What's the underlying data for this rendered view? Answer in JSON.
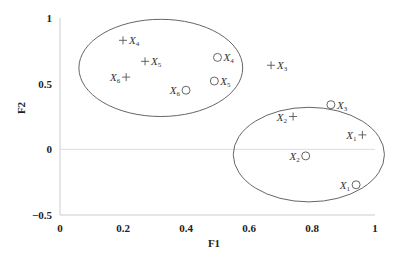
{
  "chart_data": {
    "type": "scatter",
    "title": "",
    "xlabel": "F1",
    "ylabel": "F2",
    "xlim": [
      0,
      1
    ],
    "ylim": [
      -0.5,
      1
    ],
    "x_ticks": [
      "0",
      "0.2",
      "0.4",
      "0.6",
      "0.8",
      "1"
    ],
    "y_ticks": [
      "1",
      "0.5",
      "0",
      "-0.5"
    ],
    "grid": false,
    "zero_line": true,
    "legend": null,
    "series": [
      {
        "name": "plus markers",
        "marker": "+",
        "points": [
          {
            "label": "X",
            "sub": "4",
            "x": 0.2,
            "y": 0.83,
            "label_side": "right"
          },
          {
            "label": "X",
            "sub": "5",
            "x": 0.27,
            "y": 0.67,
            "label_side": "right"
          },
          {
            "label": "X",
            "sub": "6",
            "x": 0.21,
            "y": 0.55,
            "label_side": "left"
          },
          {
            "label": "X",
            "sub": "3",
            "x": 0.67,
            "y": 0.64,
            "label_side": "right"
          },
          {
            "label": "X",
            "sub": "2",
            "x": 0.74,
            "y": 0.25,
            "label_side": "left"
          },
          {
            "label": "X",
            "sub": "1",
            "x": 0.96,
            "y": 0.11,
            "label_side": "left"
          }
        ]
      },
      {
        "name": "circle markers",
        "marker": "o",
        "points": [
          {
            "label": "X",
            "sub": "4",
            "x": 0.5,
            "y": 0.7,
            "label_side": "right"
          },
          {
            "label": "X",
            "sub": "5",
            "x": 0.49,
            "y": 0.52,
            "label_side": "right"
          },
          {
            "label": "X",
            "sub": "6",
            "x": 0.4,
            "y": 0.45,
            "label_side": "left"
          },
          {
            "label": "X",
            "sub": "3",
            "x": 0.86,
            "y": 0.34,
            "label_side": "right"
          },
          {
            "label": "X",
            "sub": "2",
            "x": 0.78,
            "y": -0.05,
            "label_side": "left"
          },
          {
            "label": "X",
            "sub": "1",
            "x": 0.94,
            "y": -0.27,
            "label_side": "left"
          }
        ]
      }
    ],
    "annotations": [
      {
        "type": "ellipse",
        "name": "cluster-upper-left",
        "cx": 0.32,
        "cy": 0.62,
        "rx": 0.26,
        "ry": 0.37
      },
      {
        "type": "ellipse",
        "name": "cluster-lower-right",
        "cx": 0.79,
        "cy": -0.04,
        "rx": 0.24,
        "ry": 0.36
      }
    ]
  },
  "colors": {
    "axis": "#cccccc",
    "zero_line": "#dddddd",
    "marker": "#555555",
    "ellipse": "#666666",
    "text": "#222222"
  }
}
